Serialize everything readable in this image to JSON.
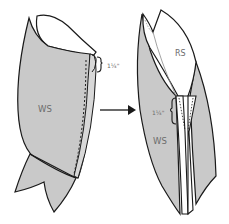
{
  "diagram": {
    "type": "sewing-instruction",
    "colors": {
      "wrong_side_fill": "#c9c9c9",
      "right_side_fill": "#ffffff",
      "outline": "#1a1a1a",
      "label": "#6b6b6b"
    },
    "step_before": {
      "ws_label": "WS",
      "measurement_label": "1¼\""
    },
    "arrow": {
      "direction": "right"
    },
    "step_after": {
      "rs_label": "RS",
      "ws_label": "WS",
      "measurement_label": "1¼\""
    }
  }
}
